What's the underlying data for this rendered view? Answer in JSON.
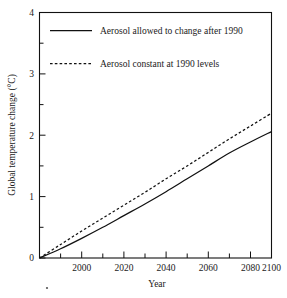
{
  "chart_data": {
    "type": "line",
    "title": "",
    "xlabel": "Year",
    "ylabel": "Global temperature change (°C)",
    "xlim": [
      1990,
      2100
    ],
    "ylim": [
      0,
      4
    ],
    "grid": false,
    "legend_position": "top-left inside plot",
    "x_major_ticks": [
      2000,
      2020,
      2040,
      2060,
      2080,
      2100
    ],
    "x_major_tick_labels": [
      "2000",
      "2020",
      "2040",
      "2060",
      "2080",
      "2100"
    ],
    "x_minor_ticks": [
      1990,
      2010,
      2030,
      2050,
      2070,
      2090
    ],
    "y_major_ticks": [
      0,
      1,
      2,
      3,
      4
    ],
    "y_major_tick_labels": [
      "0",
      "1",
      "2",
      "3",
      "4"
    ],
    "y_minor_ticks": [
      0.5,
      1.5,
      2.5,
      3.5
    ],
    "x": [
      1990,
      2000,
      2010,
      2020,
      2030,
      2040,
      2050,
      2060,
      2070,
      2080,
      2090,
      2100
    ],
    "series": [
      {
        "name": "Aerosol allowed to change after 1990",
        "style": "solid",
        "color": "#111111",
        "values": [
          0.0,
          0.15,
          0.32,
          0.5,
          0.69,
          0.88,
          1.08,
          1.29,
          1.5,
          1.71,
          1.89,
          2.06
        ]
      },
      {
        "name": "Aerosol constant at 1990 levels",
        "style": "dashed",
        "color": "#111111",
        "values": [
          0.0,
          0.22,
          0.44,
          0.65,
          0.86,
          1.07,
          1.29,
          1.5,
          1.72,
          1.94,
          2.15,
          2.36
        ]
      }
    ]
  },
  "legend": {
    "items": [
      {
        "label": "Aerosol allowed to change after 1990",
        "style": "solid"
      },
      {
        "label": "Aerosol constant at 1990 levels",
        "style": "dashed"
      }
    ]
  },
  "axes": {
    "x_title": "Year",
    "y_title": "Global temperature change (°C)"
  }
}
